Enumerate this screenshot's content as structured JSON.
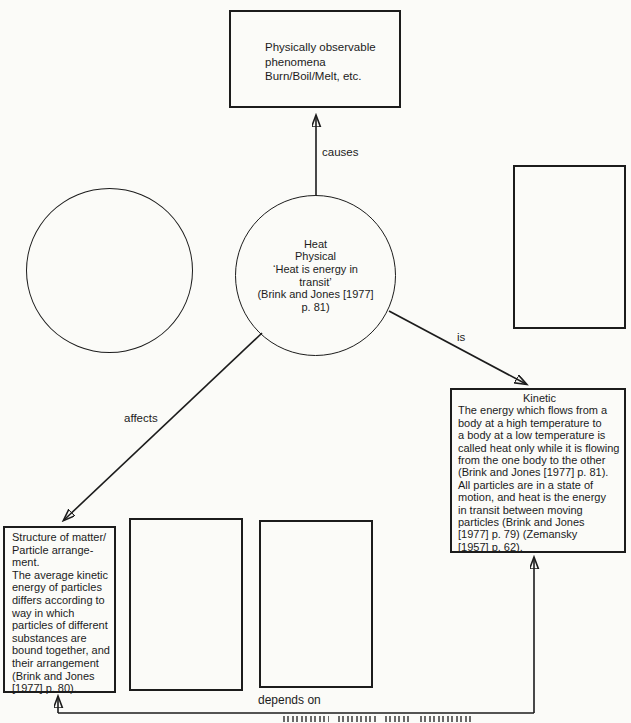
{
  "nodes": {
    "phenomena": {
      "text": "Physically observable\nphenomena\nBurn/Boil/Melt, etc."
    },
    "heat": {
      "text": "Heat\nPhysical\n‘Heat is energy in\ntransit’\n(Brink and Jones [1977]\np. 81)"
    },
    "kinetic": {
      "title": "Kinetic",
      "body": "The energy which flows from a\nbody at a high temperature to\na body at a low temperature is\ncalled heat only while it is flowing\nfrom the one body to the other\n(Brink and Jones [1977] p. 81).\nAll particles are in a state of\nmotion, and heat is the energy\nin transit between moving\nparticles (Brink and Jones\n[1977] p. 79) (Zemansky\n[1957] p. 62)."
    },
    "structure": {
      "text": "Structure of matter/\nParticle arrange-\nment.\nThe average kinetic\nenergy of particles\ndiffers according to\nway in which\nparticles of different\nsubstances are\nbound together, and\ntheir arrangement\n(Brink and Jones\n[1977] p. 80)."
    },
    "empty_circle_left": {
      "text": ""
    },
    "empty_box_right": {
      "text": ""
    },
    "empty_box_bottom_1": {
      "text": ""
    },
    "empty_box_bottom_2": {
      "text": ""
    }
  },
  "edges": {
    "causes": {
      "label": "causes"
    },
    "is": {
      "label": "is"
    },
    "affects": {
      "label": "affects"
    },
    "depends_on": {
      "label": "depends on"
    }
  },
  "colors": {
    "line": "#1c1c1c",
    "background": "#fbfbf8",
    "text": "#1c1c1c"
  }
}
